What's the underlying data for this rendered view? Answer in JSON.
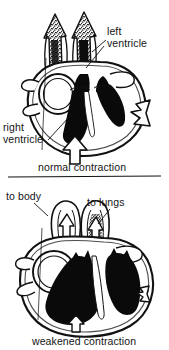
{
  "figure": {
    "type": "anatomical-line-drawing",
    "background_color": "#ffffff",
    "ink_color": "#111111",
    "panels": [
      {
        "id": "normal",
        "caption": "normal contraction",
        "description": "Cross-section of a heart with thick ventricular walls, small ventricular chambers filled solid black, and large bold outflow arrows indicating strong ejection of blood.",
        "arrows": [
          {
            "name": "aorta-outflow-arrow",
            "direction": "up",
            "size": "large"
          },
          {
            "name": "pulmonary-outflow-arrow",
            "direction": "up",
            "size": "large"
          },
          {
            "name": "apex-contraction-arrow",
            "direction": "up",
            "size": "large"
          },
          {
            "name": "lateral-wall-contraction-arrow",
            "direction": "left",
            "size": "large"
          }
        ],
        "labels": [
          {
            "id": "left-ventricle",
            "lines": [
              "left",
              "ventricle"
            ]
          },
          {
            "id": "right-ventricle",
            "lines": [
              "right",
              "ventricle"
            ]
          }
        ]
      },
      {
        "id": "weakened",
        "caption": "weakened contraction",
        "description": "Cross-section of an enlarged, dilated heart with thin ventricular walls, large black-filled chambers, and small weak outflow arrows indicating reduced ejection of blood.",
        "arrows": [
          {
            "name": "to-body-outflow-arrow",
            "direction": "up",
            "size": "small"
          },
          {
            "name": "to-lungs-outflow-arrow",
            "direction": "up",
            "size": "small"
          },
          {
            "name": "apex-contraction-arrow",
            "direction": "up",
            "size": "small"
          },
          {
            "name": "lateral-wall-contraction-arrow",
            "direction": "left",
            "size": "small"
          }
        ],
        "labels": [
          {
            "id": "to-body",
            "lines": [
              "to body"
            ]
          },
          {
            "id": "to-lungs",
            "lines": [
              "to lungs"
            ]
          }
        ]
      }
    ],
    "divider": {
      "name": "panel-divider",
      "orientation": "horizontal"
    }
  },
  "labels": {
    "left_ventricle_line1": "left",
    "left_ventricle_line2": "ventricle",
    "right_ventricle_line1": "right",
    "right_ventricle_line2": "ventricle",
    "to_body": "to body",
    "to_lungs": "to lungs"
  },
  "captions": {
    "normal": "normal contraction",
    "weakened": "weakened contraction"
  }
}
